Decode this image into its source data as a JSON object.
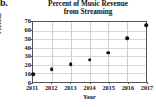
{
  "figure": {
    "part_label": "b."
  },
  "chart_data": {
    "type": "scatter",
    "title": "Percent of Music Revenue from Streaming",
    "title_lines": [
      "Percent of Music Revenue",
      "from Streaming"
    ],
    "xlabel": "Year",
    "ylabel": "Percent",
    "x": [
      2011,
      2012,
      2013,
      2014,
      2015,
      2016,
      2017
    ],
    "values": [
      9,
      15,
      21,
      26,
      34,
      51,
      66
    ],
    "categories": [
      "2011",
      "2012",
      "2013",
      "2014",
      "2015",
      "2016",
      "2017"
    ],
    "xtick_labels": [
      "2011",
      "2012",
      "2013",
      "2014",
      "2015",
      "2016",
      "2017"
    ],
    "ytick_labels": [
      "0",
      "10",
      "20",
      "30",
      "40",
      "50",
      "60",
      "70"
    ],
    "yticks": [
      0,
      10,
      20,
      30,
      40,
      50,
      60,
      70
    ],
    "xlim": [
      2011,
      2017
    ],
    "ylim": [
      0,
      70
    ],
    "grid": true,
    "legend": null,
    "marker_color": "#111111",
    "point_labels": [
      "2011: 9",
      "2012: 15",
      "2013: 21",
      "2014: 26",
      "2015: 34",
      "2016: 51",
      "2017: 66"
    ]
  }
}
